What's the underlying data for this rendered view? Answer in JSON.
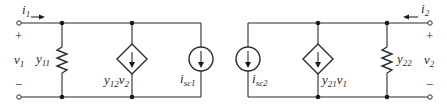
{
  "diagram": {
    "type": "two-port y-parameter equivalent circuit (Norton form)",
    "colors": {
      "line": "#2b2b2b",
      "background": "#ffffff"
    },
    "port1": {
      "current": {
        "main": "i",
        "sub": "1"
      },
      "voltage": {
        "main": "v",
        "sub": "1"
      },
      "plus": "+",
      "minus": "−"
    },
    "port2": {
      "current": {
        "main": "i",
        "sub": "2"
      },
      "voltage": {
        "main": "v",
        "sub": "2"
      },
      "plus": "+",
      "minus": "−"
    },
    "components": {
      "y11": {
        "main": "y",
        "sub": "11",
        "kind": "resistor"
      },
      "y12v2": {
        "main1": "y",
        "sub1": "12",
        "main2": "v",
        "sub2": "2",
        "kind": "dependent current source"
      },
      "isc1": {
        "main": "i",
        "sub": "sc1",
        "kind": "independent current source"
      },
      "isc2": {
        "main": "i",
        "sub": "sc2",
        "kind": "independent current source"
      },
      "y21v1": {
        "main1": "y",
        "sub1": "21",
        "main2": "v",
        "sub2": "1",
        "kind": "dependent current source"
      },
      "y22": {
        "main": "y",
        "sub": "22",
        "kind": "resistor"
      }
    }
  }
}
